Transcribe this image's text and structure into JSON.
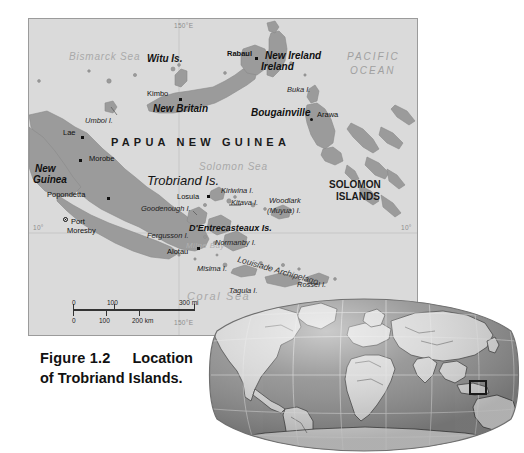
{
  "figure": {
    "number": "Figure 1.2",
    "title_line1": "Location",
    "title_line2": "of Trobriand Islands."
  },
  "map": {
    "graticule": {
      "top_meridian": "150°E",
      "bottom_meridian": "150°E",
      "left_parallel": "10°",
      "right_parallel": "10°"
    },
    "oceans": [
      {
        "name": "Bismarck Sea",
        "x": 40,
        "y": 33
      },
      {
        "name": "Solomon Sea",
        "x": 170,
        "y": 143
      },
      {
        "name": "Coral Sea",
        "x": 158,
        "y": 272
      }
    ],
    "ocean_major": [
      {
        "name_line1": "PACIFIC",
        "name_line2": "OCEAN",
        "x": 318,
        "y": 36
      }
    ],
    "bays": [
      {
        "name": "Milne Bay",
        "x": 157,
        "y": 223
      }
    ],
    "countries": [
      {
        "name": "PAPUA NEW GUINEA",
        "x": 98,
        "y": 120,
        "style": "spaced"
      }
    ],
    "countries_block": [
      {
        "line1": "SOLOMON",
        "line2": "ISLANDS",
        "x": 305,
        "y": 165
      }
    ],
    "regions": [
      {
        "name": "Witu Is.",
        "x": 142,
        "y": 38
      },
      {
        "name": "New Ireland",
        "x": 228,
        "y": 37
      },
      {
        "name": "New Britain",
        "x": 148,
        "y": 88
      },
      {
        "name": "Bougainville",
        "x": 243,
        "y": 91
      },
      {
        "name": "New",
        "x": 22,
        "y": 147
      },
      {
        "name": "Guinea",
        "x": 20,
        "y": 157
      },
      {
        "name": "D'Entrecasteaux Is.",
        "x": 176,
        "y": 208
      }
    ],
    "big_regions": [
      {
        "name": "Trobriand Is.",
        "x": 148,
        "y": 160
      }
    ],
    "islands": [
      {
        "name": "Umboi I.",
        "x": 75,
        "y": 99
      },
      {
        "name": "Buka I.",
        "x": 268,
        "y": 69
      },
      {
        "name": "Kiriwina I.",
        "x": 195,
        "y": 174
      },
      {
        "name": "Kitava I.",
        "x": 208,
        "y": 186
      },
      {
        "name": "Woodlark",
        "x": 250,
        "y": 182
      },
      {
        "name": "(Muyua) I.",
        "x": 249,
        "y": 192
      },
      {
        "name": "Goodenough I.",
        "x": 133,
        "y": 190
      },
      {
        "name": "Fergusson I.",
        "x": 127,
        "y": 215
      },
      {
        "name": "Normanby I.",
        "x": 198,
        "y": 223
      },
      {
        "name": "Misima I.",
        "x": 185,
        "y": 250
      },
      {
        "name": "Tagula I.",
        "x": 213,
        "y": 270
      },
      {
        "name": "Rossel I.",
        "x": 275,
        "y": 267
      }
    ],
    "archipelago_label": {
      "name": "Louisiade Archipelago",
      "x": 228,
      "y": 243
    },
    "towns": [
      {
        "name": "Rabaul",
        "x": 206,
        "y": 33,
        "dot_x": 227,
        "dot_y": 40,
        "symbol": "square"
      },
      {
        "name": "Kimbo",
        "x": 122,
        "y": 74,
        "dot_x": 152,
        "dot_y": 82,
        "symbol": "square"
      },
      {
        "name": "Arawa",
        "x": 297,
        "y": 95,
        "dot_x": 290,
        "dot_y": 102,
        "symbol": "round"
      },
      {
        "name": "Lae",
        "x": 37,
        "y": 113,
        "dot_x": 56,
        "dot_y": 120,
        "symbol": "square"
      },
      {
        "name": "Morobe",
        "x": 60,
        "y": 139,
        "dot_x": 54,
        "dot_y": 144,
        "symbol": "square"
      },
      {
        "name": "Popondetta",
        "x": 20,
        "y": 175,
        "dot_x": 81,
        "dot_y": 181,
        "symbol": "square"
      },
      {
        "name": "Losuia",
        "x": 150,
        "y": 177,
        "dot_x": 180,
        "dot_y": 179,
        "symbol": "square"
      },
      {
        "name": "Alotau",
        "x": 140,
        "y": 232,
        "dot_x": 170,
        "dot_y": 231,
        "symbol": "square"
      }
    ],
    "capital": {
      "name_line1": "Port",
      "name_line2": "Moresby",
      "x": 40,
      "y": 202,
      "dot_x": 36,
      "dot_y": 201
    },
    "scalebar": {
      "miles_labels": [
        "0",
        "100",
        "300 mi"
      ],
      "km_labels": [
        "0",
        "100",
        "200 km"
      ]
    },
    "colors": {
      "land": "#9b9b9b",
      "sea": "#dcdcdc",
      "frame": "#9b9b9b",
      "graticule": "#c4c4c4"
    }
  },
  "inset": {
    "type": "world-locator-globe",
    "projection": "robinson",
    "highlight_region": "Papua New Guinea",
    "colors": {
      "ocean": "#8e8e8e",
      "land": "#d5d5d5",
      "outline": "#3a3a3a",
      "graticule": "#e2e2e2"
    }
  }
}
